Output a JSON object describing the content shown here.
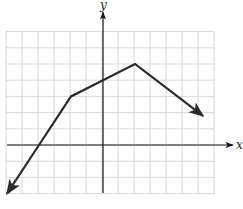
{
  "chart_data": {
    "type": "line",
    "title": "",
    "xlabel": "x",
    "ylabel": "y",
    "grid": true,
    "xlim": [
      -6,
      7
    ],
    "ylim": [
      -3,
      7
    ],
    "tick_labels": false,
    "series": [
      {
        "name": "piecewise linear function",
        "points": [
          [
            -6,
            -3
          ],
          [
            -4,
            0
          ],
          [
            -2,
            3
          ],
          [
            0,
            4
          ],
          [
            2,
            5
          ],
          [
            6.25,
            1.8
          ]
        ],
        "vertices": [
          [
            -2,
            3
          ],
          [
            2,
            5
          ]
        ],
        "arrows": [
          "start",
          "end"
        ]
      }
    ],
    "annotations": []
  },
  "axes": {
    "x_label": "x",
    "y_label": "y"
  },
  "colors": {
    "grid": "#d9d9d9",
    "axis": "#111111",
    "line": "#2a2a2a",
    "background": "#ffffff"
  }
}
